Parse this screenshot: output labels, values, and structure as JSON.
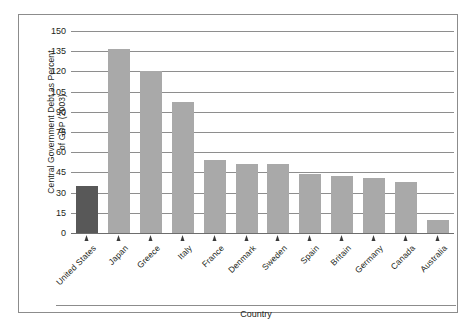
{
  "chart_data": {
    "type": "bar",
    "title": "",
    "xlabel": "Country",
    "ylabel": "Central Government Debt as Percent of GDP (2003)",
    "ylabel_line1": "Central Government Debt as Percent",
    "ylabel_line2": "of GDP (2003)",
    "categories": [
      "United States",
      "Japan",
      "Greece",
      "Italy",
      "France",
      "Denmark",
      "Sweden",
      "Spain",
      "Britain",
      "Germany",
      "Canada",
      "Australia"
    ],
    "values": [
      35,
      137,
      120,
      97,
      54,
      51,
      51,
      44,
      42,
      41,
      38,
      10
    ],
    "ylim": [
      0,
      150
    ],
    "yticks": [
      0,
      15,
      30,
      45,
      60,
      75,
      90,
      105,
      120,
      135,
      150
    ],
    "ytick_labels": [
      "0",
      "15",
      "30",
      "45",
      "60",
      "75",
      "90",
      "105",
      "120",
      "135",
      "150"
    ],
    "grid": true,
    "legend": "none",
    "highlight_index": 0,
    "colors": {
      "bar": "#a9a9a9",
      "bar_highlight": "#585858",
      "gridline": "#8e8e8e",
      "axis": "#6d6d6d",
      "frame": "#8c8c8c",
      "text": "#231f20",
      "background": "#ffffff"
    }
  }
}
